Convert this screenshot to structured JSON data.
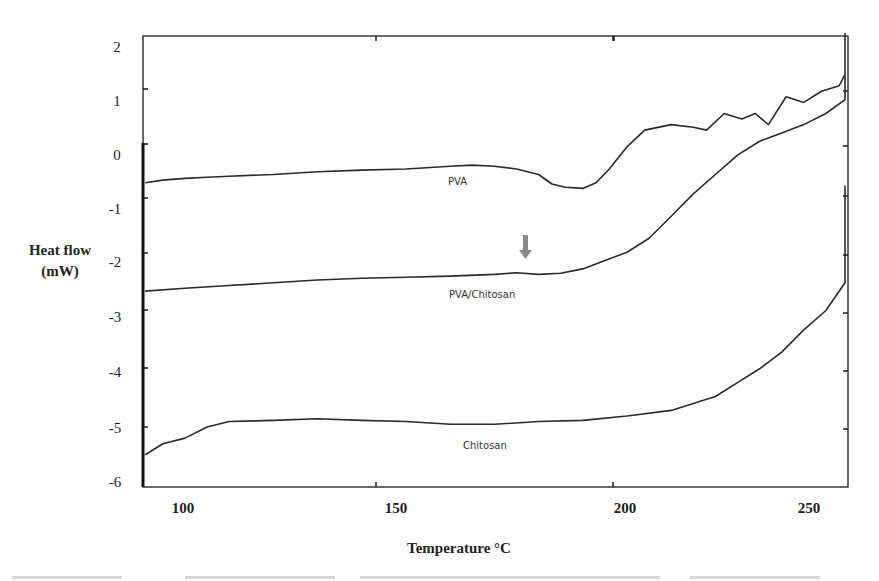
{
  "chart_data": {
    "type": "line",
    "title": "",
    "xlabel": "Temperature °C",
    "ylabel": "Heat flow (mW)",
    "ylabel_lines": [
      "Heat flow",
      "(mW)"
    ],
    "xlim": [
      91,
      258
    ],
    "ylim": [
      -6,
      2
    ],
    "x_ticks": [
      "100",
      "150",
      "200",
      "250"
    ],
    "y_ticks": [
      "2",
      "1",
      "0",
      "-1",
      "-2",
      "-3",
      "-4",
      "-5",
      "-6"
    ],
    "grid": false,
    "legend": "inline labels",
    "series": [
      {
        "name": "PVA",
        "x": [
          91,
          95,
          100,
          105,
          110,
          120,
          130,
          140,
          150,
          160,
          165,
          170,
          175,
          180,
          183,
          186,
          190,
          193,
          196,
          200,
          204,
          210,
          215,
          218,
          222,
          226,
          229,
          232,
          236,
          240,
          244,
          248,
          252,
          254,
          256
        ],
        "y": [
          -0.7,
          -0.65,
          -0.62,
          -0.6,
          -0.58,
          -0.55,
          -0.5,
          -0.47,
          -0.45,
          -0.4,
          -0.38,
          -0.4,
          -0.45,
          -0.55,
          -0.72,
          -0.78,
          -0.8,
          -0.7,
          -0.45,
          -0.05,
          0.25,
          0.35,
          0.3,
          0.25,
          0.55,
          0.45,
          0.55,
          0.35,
          0.85,
          0.75,
          0.95,
          1.05,
          1.25,
          1.6,
          2.0
        ]
      },
      {
        "name": "PVA/Chitosan",
        "x": [
          91,
          100,
          110,
          120,
          130,
          140,
          150,
          160,
          170,
          175,
          180,
          185,
          190,
          195,
          200,
          205,
          210,
          215,
          220,
          225,
          230,
          235,
          240,
          245,
          250,
          253,
          255
        ],
        "y": [
          -2.65,
          -2.6,
          -2.55,
          -2.5,
          -2.45,
          -2.42,
          -2.4,
          -2.38,
          -2.35,
          -2.32,
          -2.35,
          -2.33,
          -2.25,
          -2.1,
          -1.95,
          -1.7,
          -1.3,
          -0.9,
          -0.55,
          -0.2,
          0.05,
          0.2,
          0.35,
          0.55,
          0.8,
          1.0,
          1.25
        ]
      },
      {
        "name": "Chitosan",
        "x": [
          91,
          95,
          100,
          105,
          110,
          120,
          130,
          140,
          150,
          160,
          170,
          180,
          190,
          200,
          210,
          220,
          225,
          230,
          235,
          240,
          245,
          250,
          252,
          254,
          255,
          255.5
        ],
        "y": [
          -5.6,
          -5.4,
          -5.3,
          -5.1,
          -5.0,
          -4.98,
          -4.95,
          -4.98,
          -5.0,
          -5.05,
          -5.05,
          -5.0,
          -4.98,
          -4.9,
          -4.8,
          -4.55,
          -4.3,
          -4.05,
          -3.75,
          -3.35,
          -3.0,
          -2.5,
          -1.95,
          -1.5,
          -1.05,
          -0.75
        ]
      }
    ],
    "annotations": [
      {
        "type": "arrow",
        "direction": "down",
        "x": 179,
        "y_from": -1.65,
        "y_to": -2.1,
        "color": "#8a8a8a",
        "note": "Tg marker on PVA/Chitosan curve"
      }
    ]
  },
  "labels": {
    "pva": "PVA",
    "pva_chitosan": "PVA/Chitosan",
    "chitosan": "Chitosan"
  },
  "colors": {
    "line": "#2a2a2a",
    "axis": "#1a1a1a",
    "arrow": "#8a8a8a"
  }
}
